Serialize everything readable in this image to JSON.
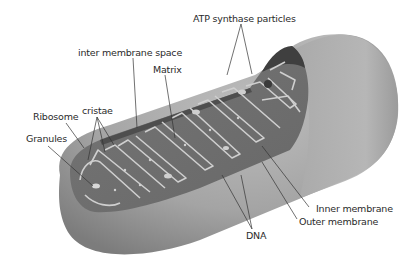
{
  "diagram": {
    "labels": {
      "atp_synthase": "ATP synthase particles",
      "inter_membrane_space": "inter membrane space",
      "matrix": "Matrix",
      "cristae": "cristae",
      "ribosome": "Ribosome",
      "granules": "Granules",
      "inner_membrane": "Inner membrane",
      "outer_membrane": "Outer membrane",
      "dna": "DNA"
    },
    "colors": {
      "outer_shell": "#a8a8a8",
      "outer_shell_dark": "#7e7e7e",
      "cut_face": "#6e6e6e",
      "interior_dark": "#4a4a4a",
      "cristae_outline": "#c9c9c9",
      "leader_line": "#333333",
      "text": "#2a2a2a"
    }
  }
}
